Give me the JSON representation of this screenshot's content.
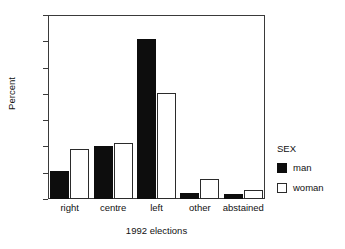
{
  "chart_data": {
    "type": "bar",
    "title": "",
    "subtitle": "",
    "xlabel": "1992 elections",
    "ylabel": "Percent",
    "categories": [
      "right",
      "centre",
      "left",
      "other",
      "abstained"
    ],
    "series": [
      {
        "name": "man",
        "values": [
          10.5,
          20.0,
          61.0,
          2.2,
          1.8
        ],
        "color": "#0d0d0d"
      },
      {
        "name": "woman",
        "values": [
          19.0,
          21.2,
          40.3,
          7.6,
          3.5
        ],
        "color": "#ffffff"
      }
    ],
    "ylim": [
      0,
      70
    ],
    "ytick_values": [
      0,
      10,
      20,
      30,
      40,
      50,
      60,
      70
    ],
    "ytick_labels": [
      "0",
      "10",
      "20",
      "30",
      "40",
      "50",
      "60",
      "70"
    ],
    "grid": false,
    "legend": {
      "title": "SEX",
      "position": "right",
      "entries": [
        {
          "label": "man",
          "swatch": "filled-black"
        },
        {
          "label": "woman",
          "swatch": "outlined-white"
        }
      ]
    },
    "colors": {
      "man": "#0d0d0d",
      "woman": "#ffffff",
      "axis": "#3a3a3a",
      "text": "#111111",
      "background": "#ffffff"
    }
  }
}
